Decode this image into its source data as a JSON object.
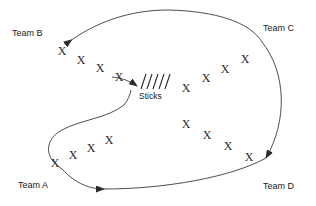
{
  "diagram": {
    "background_color": "#ffffff",
    "ink_color": "#2a2a2a",
    "center_pile": {
      "label": "Sticks",
      "stick_count": 5,
      "label_x": 152,
      "label_y": 93
    },
    "teams": [
      {
        "id": "team-a",
        "label": "Team A",
        "label_x": 18,
        "label_y": 185,
        "player_symbol": "X",
        "player_count": 4,
        "players": [
          {
            "x": 55,
            "y": 163
          },
          {
            "x": 72,
            "y": 155
          },
          {
            "x": 90,
            "y": 148
          },
          {
            "x": 107,
            "y": 140
          }
        ]
      },
      {
        "id": "team-b",
        "label": "Team B",
        "label_x": 12,
        "label_y": 33,
        "player_symbol": "X",
        "player_count": 4,
        "players": [
          {
            "x": 62,
            "y": 51
          },
          {
            "x": 80,
            "y": 59
          },
          {
            "x": 99,
            "y": 68
          },
          {
            "x": 117,
            "y": 76
          }
        ]
      },
      {
        "id": "team-c",
        "label": "Team C",
        "label_x": 265,
        "label_y": 28,
        "player_symbol": "X",
        "player_count": 4,
        "players": [
          {
            "x": 186,
            "y": 88
          },
          {
            "x": 205,
            "y": 78
          },
          {
            "x": 224,
            "y": 69
          },
          {
            "x": 243,
            "y": 59
          }
        ]
      },
      {
        "id": "team-d",
        "label": "Team D",
        "label_x": 265,
        "label_y": 186,
        "player_symbol": "X",
        "player_count": 4,
        "players": [
          {
            "x": 186,
            "y": 124
          },
          {
            "x": 206,
            "y": 134
          },
          {
            "x": 226,
            "y": 145
          },
          {
            "x": 247,
            "y": 156
          }
        ]
      }
    ],
    "flows": [
      {
        "id": "flow-top",
        "description": "top arc running right to left toward Team B",
        "direction": "leftward",
        "arrow_x": 160,
        "arrow_y": 14
      },
      {
        "id": "flow-bottom",
        "description": "bottom arc running left to right toward Team D",
        "direction": "rightward",
        "arrow_x": 103,
        "arrow_y": 188
      },
      {
        "id": "flow-center",
        "description": "S-curve from Team A loop toward the central stick pile",
        "direction": "toward-center",
        "arrow_x": 136,
        "arrow_y": 85
      }
    ]
  }
}
